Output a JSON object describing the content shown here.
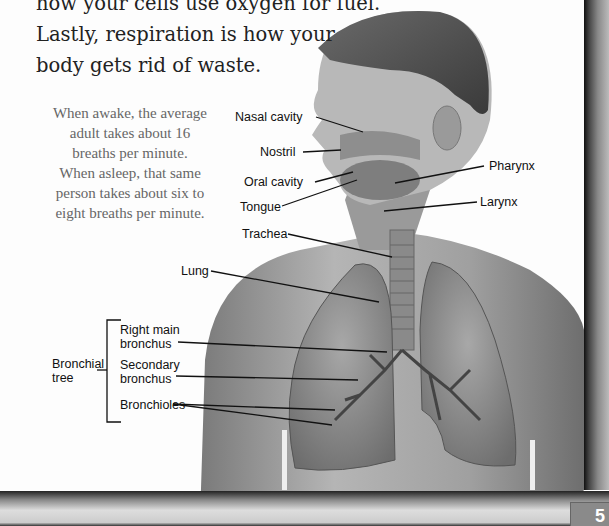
{
  "body_text": {
    "lines": [
      "how your cells use oxygen for fuel.",
      "Lastly, respiration is how your",
      "body gets rid of waste."
    ]
  },
  "fact_box": {
    "lines": [
      "When awake, the average",
      "adult takes about 16",
      "breaths per minute.",
      "When asleep, that same",
      "person takes about six to",
      "eight breaths per minute."
    ]
  },
  "diagram": {
    "labels": {
      "nasal_cavity": "Nasal cavity",
      "nostril": "Nostril",
      "oral_cavity": "Oral cavity",
      "tongue": "Tongue",
      "pharynx": "Pharynx",
      "larynx": "Larynx",
      "trachea": "Trachea",
      "lung": "Lung",
      "bronchial_tree_1": "Bronchial",
      "bronchial_tree_2": "tree",
      "right_main_bronchus_1": "Right main",
      "right_main_bronchus_2": "bronchus",
      "secondary_bronchus_1": "Secondary",
      "secondary_bronchus_2": "bronchus",
      "bronchioles": "Bronchioles"
    }
  },
  "page_number": "5"
}
